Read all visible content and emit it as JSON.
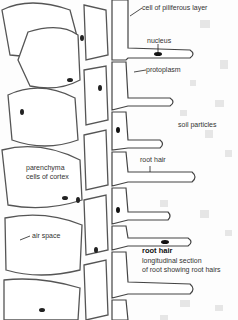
{
  "diagram": {
    "title": "root hair",
    "subtitle_line1": "longitudinal section",
    "subtitle_line2": "of root showing root hairs",
    "labels": {
      "piliferous": "cell of piliferous layer",
      "nucleus": "nucleus",
      "protoplasm": "protoplasm",
      "soil": "soil particles",
      "root_hair": "root hair",
      "parenchyma_1": "parenchyma",
      "parenchyma_2": "cells of cortex",
      "air_space": "air space"
    }
  }
}
